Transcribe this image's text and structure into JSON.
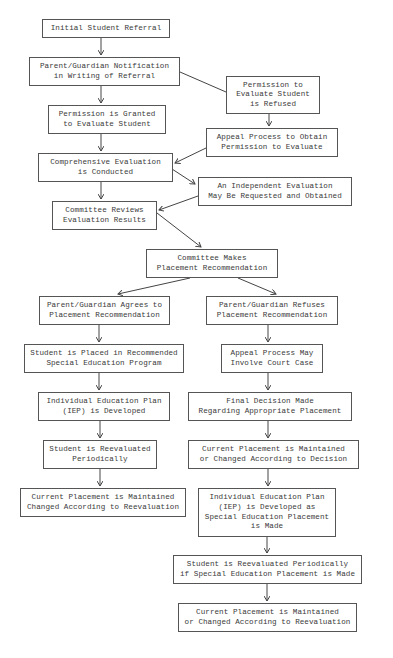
{
  "diagram": {
    "type": "flowchart",
    "colors": {
      "background": "#ffffff",
      "border": "#555555",
      "text": "#3a3a3a",
      "line": "#444444"
    },
    "nodes": [
      {
        "id": "n1",
        "label": "Initial Student Referral",
        "x": 42,
        "y": 19,
        "w": 128,
        "h": 19
      },
      {
        "id": "n2",
        "label": "Parent/Guardian Notification\nin Writing of Referral",
        "x": 29,
        "y": 57,
        "w": 151,
        "h": 29
      },
      {
        "id": "n3",
        "label": "Permission to\nEvaluate Student\nis Refused",
        "x": 226,
        "y": 76,
        "w": 94,
        "h": 38
      },
      {
        "id": "n4",
        "label": "Permission is Granted\nto Evaluate Student",
        "x": 48,
        "y": 105,
        "w": 118,
        "h": 29
      },
      {
        "id": "n5",
        "label": "Appeal Process to Obtain\nPermission to Evaluate",
        "x": 206,
        "y": 128,
        "w": 132,
        "h": 29
      },
      {
        "id": "n6",
        "label": "Comprehensive Evaluation\nis Conducted",
        "x": 38,
        "y": 153,
        "w": 135,
        "h": 29
      },
      {
        "id": "n7",
        "label": "An Independent Evaluation\nMay Be Requested and Obtained",
        "x": 198,
        "y": 177,
        "w": 154,
        "h": 29
      },
      {
        "id": "n8",
        "label": "Committee Reviews\nEvaluation Results",
        "x": 52,
        "y": 201,
        "w": 105,
        "h": 29
      },
      {
        "id": "n9",
        "label": "Committee Makes\nPlacement Recommendation",
        "x": 146,
        "y": 249,
        "w": 132,
        "h": 29
      },
      {
        "id": "n10",
        "label": "Parent/Guardian Agrees to\nPlacement Recommendation",
        "x": 39,
        "y": 296,
        "w": 131,
        "h": 29
      },
      {
        "id": "n11",
        "label": "Parent/Guardian Refuses\nPlacement Recommendation",
        "x": 206,
        "y": 296,
        "w": 132,
        "h": 29
      },
      {
        "id": "n12",
        "label": "Student is Placed in Recommended\nSpecial Education Program",
        "x": 24,
        "y": 344,
        "w": 160,
        "h": 29
      },
      {
        "id": "n13",
        "label": "Appeal Process May\nInvolve Court Case",
        "x": 221,
        "y": 344,
        "w": 102,
        "h": 29
      },
      {
        "id": "n14",
        "label": "Individual Education Plan\n(IEP) is Developed",
        "x": 38,
        "y": 392,
        "w": 132,
        "h": 29
      },
      {
        "id": "n15",
        "label": "Final Decision Made\nRegarding Appropriate Placement",
        "x": 188,
        "y": 392,
        "w": 164,
        "h": 29
      },
      {
        "id": "n16",
        "label": "Student is Reevaluated\nPeriodically",
        "x": 43,
        "y": 440,
        "w": 114,
        "h": 29
      },
      {
        "id": "n17",
        "label": "Current Placement is Maintained\nor Changed According to Decision",
        "x": 188,
        "y": 440,
        "w": 171,
        "h": 29
      },
      {
        "id": "n18",
        "label": "Current Placement is Maintained\nChanged According to Reevaluation",
        "x": 20,
        "y": 488,
        "w": 166,
        "h": 29
      },
      {
        "id": "n19",
        "label": "Individual Education Plan\n(IEP) is Developed as\nSpecial Education Placement\nis Made",
        "x": 198,
        "y": 488,
        "w": 138,
        "h": 49
      },
      {
        "id": "n20",
        "label": "Student is Reevaluated Periodically\nif Special Education Placement is Made",
        "x": 173,
        "y": 555,
        "w": 189,
        "h": 29
      },
      {
        "id": "n21",
        "label": "Current Placement is Maintained\nor Changed According to Reevaluation",
        "x": 178,
        "y": 603,
        "w": 179,
        "h": 29
      }
    ],
    "edges": [
      {
        "from": "n1",
        "to": "n2",
        "x1": 101,
        "y1": 38,
        "x2": 101,
        "y2": 55,
        "arrow": true
      },
      {
        "from": "n2",
        "to": "n3",
        "x1": 180,
        "y1": 72,
        "x2": 226,
        "y2": 92,
        "arrow": false
      },
      {
        "from": "n2",
        "to": "n4",
        "x1": 101,
        "y1": 86,
        "x2": 101,
        "y2": 103,
        "arrow": true
      },
      {
        "from": "n3",
        "to": "n5",
        "x1": 269,
        "y1": 114,
        "x2": 269,
        "y2": 126,
        "arrow": true
      },
      {
        "from": "n4",
        "to": "n6",
        "x1": 101,
        "y1": 134,
        "x2": 101,
        "y2": 151,
        "arrow": true
      },
      {
        "from": "n5",
        "to": "n6",
        "x1": 206,
        "y1": 148,
        "x2": 175,
        "y2": 163,
        "arrow": true
      },
      {
        "from": "n6",
        "to": "n7",
        "x1": 172,
        "y1": 169,
        "x2": 195,
        "y2": 184,
        "arrow": true
      },
      {
        "from": "n6",
        "to": "n8",
        "x1": 101,
        "y1": 182,
        "x2": 101,
        "y2": 199,
        "arrow": true
      },
      {
        "from": "n7",
        "to": "n8",
        "x1": 198,
        "y1": 196,
        "x2": 159,
        "y2": 210,
        "arrow": true
      },
      {
        "from": "n8",
        "to": "n9",
        "x1": 157,
        "y1": 213,
        "x2": 201,
        "y2": 247,
        "arrow": true
      },
      {
        "from": "n9",
        "to": "n10",
        "x1": 190,
        "y1": 278,
        "x2": 118,
        "y2": 294,
        "arrow": true
      },
      {
        "from": "n9",
        "to": "n11",
        "x1": 238,
        "y1": 278,
        "x2": 276,
        "y2": 294,
        "arrow": true
      },
      {
        "from": "n10",
        "to": "n12",
        "x1": 99,
        "y1": 325,
        "x2": 99,
        "y2": 342,
        "arrow": true
      },
      {
        "from": "n11",
        "to": "n13",
        "x1": 268,
        "y1": 325,
        "x2": 268,
        "y2": 342,
        "arrow": true
      },
      {
        "from": "n12",
        "to": "n14",
        "x1": 99,
        "y1": 373,
        "x2": 99,
        "y2": 390,
        "arrow": true
      },
      {
        "from": "n13",
        "to": "n15",
        "x1": 268,
        "y1": 373,
        "x2": 268,
        "y2": 390,
        "arrow": true
      },
      {
        "from": "n14",
        "to": "n16",
        "x1": 100,
        "y1": 421,
        "x2": 100,
        "y2": 438,
        "arrow": true
      },
      {
        "from": "n15",
        "to": "n17",
        "x1": 268,
        "y1": 421,
        "x2": 268,
        "y2": 438,
        "arrow": true
      },
      {
        "from": "n16",
        "to": "n18",
        "x1": 100,
        "y1": 469,
        "x2": 100,
        "y2": 486,
        "arrow": true
      },
      {
        "from": "n17",
        "to": "n19",
        "x1": 268,
        "y1": 469,
        "x2": 268,
        "y2": 486,
        "arrow": true
      },
      {
        "from": "n19",
        "to": "n20",
        "x1": 267,
        "y1": 537,
        "x2": 267,
        "y2": 553,
        "arrow": true
      },
      {
        "from": "n20",
        "to": "n21",
        "x1": 267,
        "y1": 584,
        "x2": 267,
        "y2": 601,
        "arrow": true
      }
    ]
  }
}
